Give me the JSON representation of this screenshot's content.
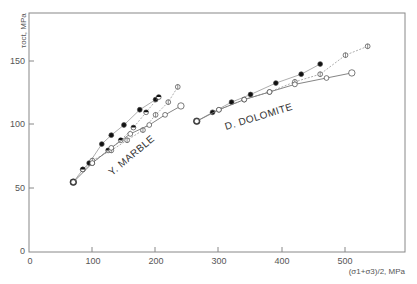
{
  "chart_data": {
    "type": "scatter",
    "title": "",
    "xlabel": "(σ1+σ3)/2, MPa",
    "ylabel": "τoct, MPa",
    "xlim": [
      0,
      590
    ],
    "ylim": [
      0,
      190
    ],
    "x_ticks": [
      0,
      100,
      200,
      300,
      400,
      500
    ],
    "y_ticks": [
      0,
      50,
      100,
      150
    ],
    "grid": false,
    "legend": "none (inline annotations)",
    "annotations": [
      {
        "text": "Y. MARBLE",
        "x": 145,
        "y": 65,
        "rotation": -40
      },
      {
        "text": "D. DOLOMITE",
        "x": 320,
        "y": 103,
        "rotation": -17
      }
    ],
    "series": [
      {
        "name": "Y. MARBLE (filled)",
        "marker": "filled-circle",
        "x": [
          70,
          85,
          95,
          115,
          130,
          150,
          175,
          200
        ],
        "y": [
          55,
          65,
          70,
          85,
          92,
          100,
          112,
          120
        ]
      },
      {
        "name": "Y. MARBLE (half-filled)",
        "marker": "half-circle",
        "x": [
          85,
          100,
          125,
          145,
          165,
          185,
          205
        ],
        "y": [
          65,
          70,
          80,
          88,
          98,
          110,
          122
        ]
      },
      {
        "name": "Y. MARBLE (crossed)",
        "marker": "crossed-circle",
        "x": [
          100,
          130,
          155,
          180,
          200,
          220,
          235
        ],
        "y": [
          72,
          80,
          88,
          96,
          108,
          118,
          130
        ]
      },
      {
        "name": "Y. MARBLE (open)",
        "marker": "open-circle",
        "x": [
          70,
          100,
          130,
          160,
          190,
          215,
          240
        ],
        "y": [
          55,
          70,
          82,
          93,
          100,
          108,
          115
        ]
      },
      {
        "name": "D. DOLOMITE (filled)",
        "marker": "filled-circle",
        "x": [
          265,
          290,
          320,
          350,
          390,
          430,
          460
        ],
        "y": [
          103,
          110,
          118,
          124,
          133,
          140,
          148
        ]
      },
      {
        "name": "D. DOLOMITE (crossed)",
        "marker": "crossed-circle",
        "x": [
          300,
          340,
          380,
          420,
          460,
          500,
          535
        ],
        "y": [
          112,
          120,
          126,
          134,
          140,
          155,
          162
        ]
      },
      {
        "name": "D. DOLOMITE (open)",
        "marker": "open-circle",
        "x": [
          265,
          300,
          340,
          380,
          420,
          470,
          510
        ],
        "y": [
          103,
          112,
          120,
          126,
          132,
          137,
          141
        ]
      }
    ]
  },
  "labels": {
    "ylabel": "τoct, MPa",
    "xlabel": "(σ1+σ3)/2, MPa",
    "marble": "Y. MARBLE",
    "dolomite": "D. DOLOMITE",
    "x0": "0",
    "x100": "100",
    "x200": "200",
    "x300": "300",
    "x400": "400",
    "x500": "500",
    "y0": "0",
    "y50": "50",
    "y100": "100",
    "y150": "150"
  }
}
